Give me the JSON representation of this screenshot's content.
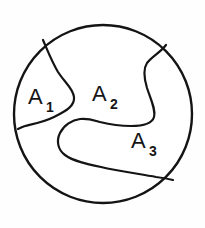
{
  "figure": {
    "background_color": "#fefefe",
    "stroke_color": "#141414",
    "fill_color": "#ffffff"
  },
  "outline": {
    "shape": "circle",
    "center_x": 103,
    "center_y": 114,
    "radius": 89,
    "stroke_width": 2.4
  },
  "regions": [
    {
      "id": "A1",
      "label": "A",
      "subscript": "1",
      "label_x": 28,
      "label_y": 104,
      "subscript_x": 46,
      "subscript_y": 112
    },
    {
      "id": "A2",
      "label": "A",
      "subscript": "2",
      "label_x": 92,
      "label_y": 101,
      "subscript_x": 110,
      "subscript_y": 109
    },
    {
      "id": "A3",
      "label": "A",
      "subscript": "3",
      "label_x": 131,
      "label_y": 148,
      "subscript_x": 149,
      "subscript_y": 156
    }
  ],
  "dividers": [
    {
      "id": "left-divider",
      "description": "S-shaped curve separating A1 from A2",
      "stroke_width": 2.2,
      "path": "M 43 40 C 49 54, 52 62, 58 72 C 65 83, 73 88, 74 97 C 75 106, 66 111, 54 117 C 44 122, 33 124, 25 126 C 22 127, 20 128, 18 129"
    },
    {
      "id": "right-divider",
      "description": "Hooked curve separating A2 from A3 and sweeping to lower right rim",
      "stroke_width": 2.2,
      "path": "M 166 45 C 160 53, 152 56, 147 63 C 143 69, 144 78, 147 88 C 151 100, 156 110, 154 117 C 152 124, 143 126, 131 126 C 118 126, 108 124, 100 122 C 93 120, 88 118, 80 119 C 72 120, 64 125, 60 133 C 56 141, 58 150, 65 155 C 73 161, 87 164, 101 167 C 118 171, 140 174, 156 177 C 164 178, 169 179, 173 180"
    }
  ],
  "labels_meta": {
    "font_size_main": 22,
    "font_size_subscript": 14
  }
}
